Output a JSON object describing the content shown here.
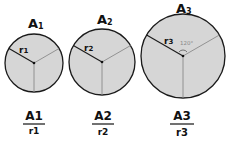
{
  "circles": [
    {
      "area_label": "A",
      "area_sub": "1",
      "radius_label": "r",
      "radius_sub": "1"
    },
    {
      "area_label": "A",
      "area_sub": "2",
      "radius_label": "r",
      "radius_sub": "2"
    },
    {
      "area_label": "A",
      "area_sub": "3",
      "radius_label": "r",
      "radius_sub": "3",
      "angle_label": "120°"
    }
  ],
  "ratios": [
    {
      "num": "A1",
      "den": "r1"
    },
    {
      "num": "A2",
      "den": "r2"
    },
    {
      "num": "A3",
      "den": "r3"
    }
  ]
}
